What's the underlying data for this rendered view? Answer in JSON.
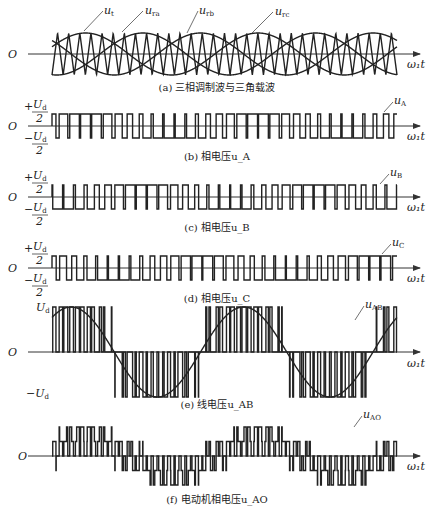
{
  "figure": {
    "panels": [
      {
        "id": "a",
        "caption": "(a) 三相调制波与三角载波",
        "axis_y": 54,
        "top": 33,
        "bottom": 78,
        "origin_label": "O",
        "x_label": "ω₁t",
        "curve_labels": [
          "u_t",
          "u_ra",
          "u_rb",
          "u_rc"
        ]
      },
      {
        "id": "b",
        "caption": "(b) 相电压u_A",
        "axis_y": 126,
        "top": 114,
        "bottom": 138,
        "y_labels": [
          "+U_d/2",
          "-U_d/2"
        ],
        "origin_label": "O",
        "x_label": "ω₁t",
        "curve_label": "u_A"
      },
      {
        "id": "c",
        "caption": "(c) 相电压u_B",
        "axis_y": 197,
        "top": 185,
        "bottom": 209,
        "y_labels": [
          "+U_d/2",
          "-U_d/2"
        ],
        "origin_label": "O",
        "x_label": "ω₁t",
        "curve_label": "u_B"
      },
      {
        "id": "d",
        "caption": "(d) 相电压u_C",
        "axis_y": 268,
        "top": 256,
        "bottom": 281,
        "y_labels": [
          "+U_d/2",
          "-U_d/2"
        ],
        "origin_label": "O",
        "x_label": "ω₁t",
        "curve_label": "u_C"
      },
      {
        "id": "e",
        "caption": "(e) 线电压u_AB",
        "axis_y": 352,
        "top": 307,
        "bottom": 393,
        "y_labels": [
          "U_d",
          "-U_d"
        ],
        "origin_label": "O",
        "x_label": "ω₁t",
        "curve_label": "u_AB"
      },
      {
        "id": "f",
        "caption": "(f) 电动机相电压u_AO",
        "axis_y": 456,
        "top": 427,
        "bottom": 485,
        "origin_label": "O",
        "x_label": "ω₁t",
        "curve_label": "u_AO"
      }
    ],
    "pwm": {
      "x_start": 52,
      "x_end": 397,
      "modulation_periods": 2,
      "carrier_ratio": 15.5,
      "modulation_index": 0.8
    }
  }
}
